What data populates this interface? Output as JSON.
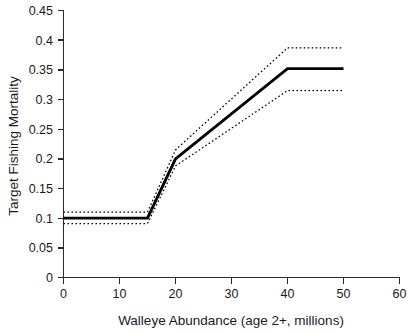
{
  "chart_data": {
    "type": "line",
    "title": "",
    "xlabel": "Walleye Abundance (age 2+, millions)",
    "ylabel": "Target Fishing Mortality",
    "xlim": [
      0,
      60
    ],
    "ylim": [
      0,
      0.45
    ],
    "xticks": [
      0,
      10,
      20,
      30,
      40,
      50,
      60
    ],
    "xtick_labels": [
      "0",
      "10",
      "20",
      "30",
      "40",
      "50",
      "60"
    ],
    "yticks": [
      0,
      0.05,
      0.1,
      0.15,
      0.2,
      0.25,
      0.3,
      0.35,
      0.4,
      0.45
    ],
    "ytick_labels": [
      "0",
      "0.05",
      "0.1",
      "0.15",
      "0.2",
      "0.25",
      "0.3",
      "0.35",
      "0.4",
      "0.45"
    ],
    "grid": false,
    "legend": false,
    "legend_position": "none",
    "series": [
      {
        "name": "Target fishing mortality (control rule)",
        "style": "solid",
        "color": "#000000",
        "x": [
          0,
          15,
          20,
          40,
          50
        ],
        "values": [
          0.1,
          0.1,
          0.2,
          0.352,
          0.352
        ]
      },
      {
        "name": "Upper confidence bound",
        "style": "dotted",
        "color": "#000000",
        "x": [
          0,
          15,
          20,
          40,
          50
        ],
        "values": [
          0.11,
          0.11,
          0.215,
          0.387,
          0.387
        ]
      },
      {
        "name": "Lower confidence bound",
        "style": "dotted",
        "color": "#000000",
        "x": [
          0,
          15,
          20,
          40,
          50
        ],
        "values": [
          0.091,
          0.091,
          0.188,
          0.315,
          0.315
        ]
      }
    ],
    "annotations": []
  },
  "axes": {
    "x_title": "Walleye Abundance (age 2+, millions)",
    "y_title": "Target Fishing Mortality"
  },
  "xtick": {
    "t0": "0",
    "t1": "10",
    "t2": "20",
    "t3": "30",
    "t4": "40",
    "t5": "50",
    "t6": "60"
  },
  "ytick": {
    "t0": "0",
    "t1": "0.05",
    "t2": "0.1",
    "t3": "0.15",
    "t4": "0.2",
    "t5": "0.25",
    "t6": "0.3",
    "t7": "0.35",
    "t8": "0.4",
    "t9": "0.45"
  }
}
